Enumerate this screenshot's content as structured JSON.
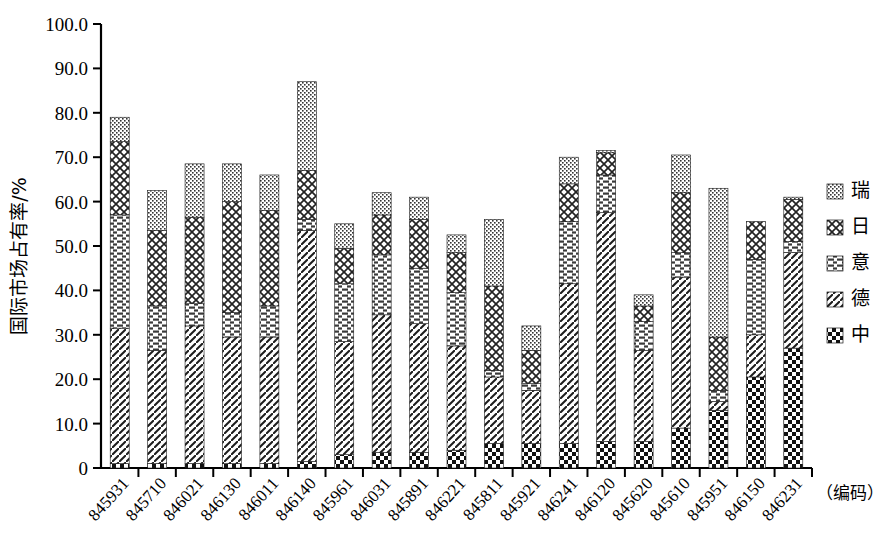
{
  "chart_data": {
    "type": "bar",
    "subtype": "stacked-bar",
    "title": "",
    "xlabel": "（编码）",
    "ylabel": "国际市场占有率/%",
    "ylim": [
      0,
      100
    ],
    "ytick_labels": [
      "0",
      "10.0",
      "20.0",
      "30.0",
      "40.0",
      "50.0",
      "60.0",
      "70.0",
      "80.0",
      "90.0",
      "100.0"
    ],
    "ytick_values": [
      0,
      10,
      20,
      30,
      40,
      50,
      60,
      70,
      80,
      90,
      100
    ],
    "grid": false,
    "legend_position": "right",
    "categories": [
      "845931",
      "845710",
      "846021",
      "846130",
      "846011",
      "846140",
      "845961",
      "846031",
      "845891",
      "846221",
      "845811",
      "845921",
      "846241",
      "846120",
      "845620",
      "845610",
      "845951",
      "846150",
      "846231"
    ],
    "series": [
      {
        "name": "中",
        "pattern": "checker",
        "values": [
          1.0,
          1.0,
          1.0,
          1.0,
          1.0,
          1.5,
          3.0,
          3.5,
          3.5,
          4.0,
          5.5,
          5.5,
          5.5,
          6.0,
          6.0,
          9.0,
          13.0,
          20.5,
          27.0
        ]
      },
      {
        "name": "德",
        "pattern": "diagonal",
        "values": [
          30.5,
          25.5,
          31.0,
          28.5,
          28.5,
          52.0,
          25.5,
          31.0,
          29.0,
          23.5,
          15.0,
          12.0,
          36.0,
          51.5,
          20.5,
          34.0,
          2.0,
          9.5,
          21.5
        ]
      },
      {
        "name": "意",
        "pattern": "horizontal",
        "values": [
          25.5,
          10.0,
          5.0,
          5.5,
          7.0,
          2.5,
          13.0,
          13.5,
          12.5,
          12.0,
          1.5,
          1.5,
          14.0,
          8.5,
          6.5,
          5.5,
          2.5,
          17.0,
          2.5
        ]
      },
      {
        "name": "日",
        "pattern": "crosshatch",
        "values": [
          16.5,
          17.0,
          19.5,
          25.0,
          21.5,
          11.0,
          8.0,
          9.0,
          11.0,
          9.0,
          19.0,
          7.5,
          8.5,
          5.0,
          3.5,
          13.5,
          12.0,
          8.5,
          9.5
        ]
      },
      {
        "name": "瑞",
        "pattern": "dotted",
        "values": [
          5.5,
          9.0,
          12.0,
          8.5,
          8.0,
          20.0,
          5.5,
          5.0,
          5.0,
          4.0,
          15.0,
          5.5,
          6.0,
          0.5,
          2.5,
          8.5,
          33.5,
          0.0,
          0.5
        ]
      }
    ],
    "totals": [
      79.0,
      62.5,
      68.5,
      68.5,
      66.0,
      87.0,
      55.0,
      62.0,
      61.0,
      52.5,
      56.0,
      32.0,
      70.0,
      71.5,
      39.0,
      70.5,
      63.0,
      55.5,
      61.0
    ]
  },
  "legend": {
    "items": [
      {
        "label": "瑞",
        "pattern": "dotted"
      },
      {
        "label": "日",
        "pattern": "crosshatch"
      },
      {
        "label": "意",
        "pattern": "horizontal"
      },
      {
        "label": "德",
        "pattern": "diagonal"
      },
      {
        "label": "中",
        "pattern": "checker"
      }
    ]
  },
  "axes": {
    "y_title": "国际市场占有率/%",
    "x_unit": "（编码）"
  }
}
